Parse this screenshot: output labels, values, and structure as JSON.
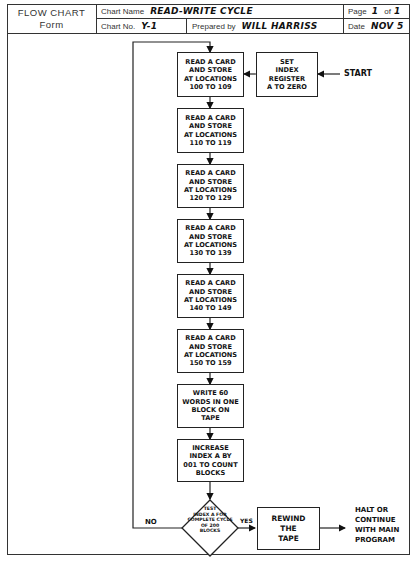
{
  "header": {
    "form_title_line1": "FLOW CHART",
    "form_title_line2": "Form",
    "chart_name_label": "Chart Name",
    "chart_name_value": "READ-WRITE CYCLE",
    "page_label": "Page",
    "page_current": "1",
    "page_of_label": "of",
    "page_total": "1",
    "chart_no_label": "Chart No.",
    "chart_no_value": "Y-1",
    "prepared_by_label": "Prepared by",
    "prepared_by_value": "WILL HARRISS",
    "date_label": "Date",
    "date_value": "NOV 5"
  },
  "flowchart": {
    "start_label": "START",
    "init_box": "SET\nINDEX\nREGISTER\nA TO ZERO",
    "steps": [
      "READ A CARD\nAND STORE\nAT LOCATIONS\n100 TO 109",
      "READ A CARD\nAND STORE\nAT LOCATIONS\n110 TO 119",
      "READ A CARD\nAND STORE\nAT LOCATIONS\n120 TO 129",
      "READ A CARD\nAND STORE\nAT LOCATIONS\n130 TO 139",
      "READ A CARD\nAND STORE\nAT LOCATIONS\n140 TO 149",
      "READ A CARD\nAND STORE\nAT LOCATIONS\n150 TO 159",
      "WRITE 60\nWORDS IN ONE\nBLOCK ON\nTAPE",
      "INCREASE\nINDEX A BY\n001 TO COUNT\nBLOCKS"
    ],
    "decision": "TEST\nINDEX A FOR\nCOMPLETE CYCLE\nOF 200\nBLOCKS",
    "no_label": "NO",
    "yes_label": "YES",
    "rewind_box": "REWIND\nTHE\nTAPE",
    "end_label": "HALT OR\nCONTINUE\nWITH MAIN\nPROGRAM"
  }
}
